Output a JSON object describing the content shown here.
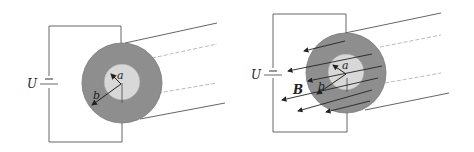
{
  "figure": {
    "left": {
      "voltage_label": "U",
      "inner_radius_label": "a",
      "outer_radius_label": "b"
    },
    "right": {
      "voltage_label": "U",
      "inner_radius_label": "a",
      "outer_radius_label": "b",
      "field_label": "B"
    }
  },
  "colors": {
    "outer_shell": "#8c8c8c",
    "inner_core": "#d6d6d6",
    "wire": "#444444",
    "dashed": "#999999",
    "field_arrow": "#222222"
  }
}
